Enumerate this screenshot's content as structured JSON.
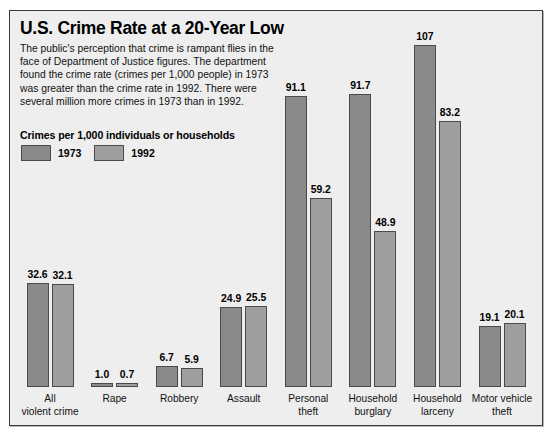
{
  "panel": {
    "title": "U.S. Crime Rate at a 20-Year Low",
    "deck": "The public's perception that crime is rampant flies in the face of Department of Justice figures. The department found the crime rate (crimes per 1,000 people) in 1973 was greater than the crime rate in 1992. There were several million more crimes in 1973 than in 1992.",
    "legend_title": "Crimes per 1,000 individuals or households"
  },
  "colors": {
    "series_1973": "#8a8a8a",
    "series_1992": "#9e9e9e",
    "panel_background": "#eeeeee",
    "panel_border": "#3a3a3a",
    "bar_outline": "#4a4a4a",
    "text": "#000000"
  },
  "chart_data": {
    "type": "bar",
    "title": "U.S. Crime Rate at a 20-Year Low",
    "subtitle": "Crimes per 1,000 individuals or households",
    "xlabel": "",
    "ylabel": "Crimes per 1,000 individuals or households",
    "ylim": [
      0,
      107
    ],
    "grid": false,
    "legend_position": "top-left",
    "categories": [
      "All violent crime",
      "Rape",
      "Robbery",
      "Assault",
      "Personal theft",
      "Household burglary",
      "Household larceny",
      "Motor vehicle theft"
    ],
    "series": [
      {
        "name": "1973",
        "values": [
          32.6,
          1.0,
          6.7,
          24.9,
          91.1,
          91.7,
          107,
          19.1
        ],
        "labels": [
          "32.6",
          "1.0",
          "6.7",
          "24.9",
          "91.1",
          "91.7",
          "107",
          "19.1"
        ]
      },
      {
        "name": "1992",
        "values": [
          32.1,
          0.7,
          5.9,
          25.5,
          59.2,
          48.9,
          83.2,
          20.1
        ],
        "labels": [
          "32.1",
          "0.7",
          "5.9",
          "25.5",
          "59.2",
          "48.9",
          "83.2",
          "20.1"
        ]
      }
    ]
  }
}
